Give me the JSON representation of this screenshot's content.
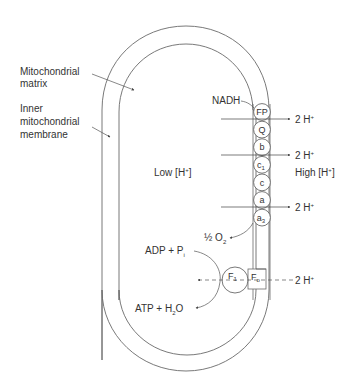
{
  "diagram": {
    "labels": {
      "matrix_line1": "Mitochondrial",
      "matrix_line2": "matrix",
      "membrane_line1": "Inner",
      "membrane_line2": "mitochondrial",
      "membrane_line3": "membrane",
      "low": "Low [H",
      "high": "High [H",
      "ion_sup": "+",
      "bracket_close": "]",
      "nadh": "NADH",
      "proton_out": "2 H",
      "half_o2_pre": "½ O",
      "o2_sub": "2",
      "adp": "ADP + P",
      "adp_sub": "i",
      "atp": "ATP + H",
      "atp_sub": "2",
      "atp_tail": "O",
      "f1": "F",
      "f1_sub": "1",
      "fo": "F",
      "fo_sub": "o"
    },
    "chain_carriers": [
      {
        "label": "FP",
        "sub": ""
      },
      {
        "label": "Q",
        "sub": ""
      },
      {
        "label": "b",
        "sub": ""
      },
      {
        "label": "c",
        "sub": "1"
      },
      {
        "label": "c",
        "sub": ""
      },
      {
        "label": "a",
        "sub": ""
      },
      {
        "label": "a",
        "sub": "3"
      }
    ],
    "proton_pumps": [
      "2 H+",
      "2 H+",
      "2 H+",
      "2 H+"
    ]
  }
}
